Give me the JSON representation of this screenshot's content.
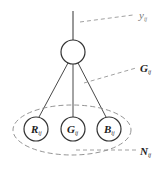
{
  "diagram": {
    "type": "graphical-model",
    "colors": {
      "stroke": "#333333",
      "dashed": "#888888",
      "label": "#222222",
      "label_light": "#777777",
      "background": "#ffffff"
    },
    "output_label": {
      "main": "y",
      "sub": "ij"
    },
    "gray_node_label": {
      "main": "G",
      "sub": "ij"
    },
    "neighborhood_label": {
      "main": "N",
      "sub": "ij"
    },
    "nodes": [
      {
        "id": "R",
        "main": "R",
        "sub": "ij"
      },
      {
        "id": "G",
        "main": "G",
        "sub": "ij"
      },
      {
        "id": "B",
        "main": "B",
        "sub": "ij"
      }
    ]
  }
}
